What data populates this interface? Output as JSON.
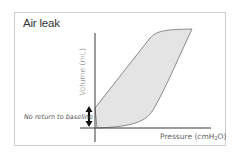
{
  "diagram": {
    "title": "Air leak",
    "y_axis_label": "Volume (mL)",
    "x_axis_label_main": "Pressure (cmH",
    "x_axis_label_sub": "2",
    "x_axis_label_end": "O)",
    "annotation": "No return to baseline",
    "colors": {
      "loop_fill": "#e4e4e4",
      "loop_stroke": "#8a8a8a",
      "axis": "#3a3a3a",
      "frame": "#cfcfcf",
      "arrow": "#111111"
    }
  }
}
